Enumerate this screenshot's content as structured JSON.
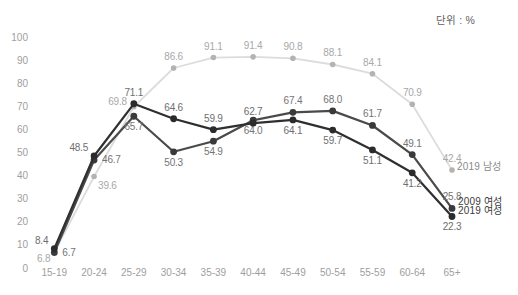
{
  "unit_label": "단위 : %",
  "colors": {
    "background": "#ffffff",
    "axis_label": "#9e9e9e",
    "unit_label_text": "#5f5f5f",
    "legend_male_text": "#8a8a8a",
    "legend_female_text": "#3a3a3a"
  },
  "chart_data": {
    "type": "line",
    "title": "",
    "unit": "단위 : %",
    "categories": [
      "15-19",
      "20-24",
      "25-29",
      "30-34",
      "35-39",
      "40-44",
      "45-49",
      "50-54",
      "55-59",
      "60-64",
      "65+"
    ],
    "y_ticks": [
      0,
      10,
      20,
      30,
      40,
      50,
      60,
      70,
      80,
      90,
      100
    ],
    "ylim": [
      0,
      100
    ],
    "grid": false,
    "legend_position": "right-end",
    "series": [
      {
        "name": "2019 남성",
        "values": [
          6.8,
          39.6,
          69.8,
          86.6,
          91.1,
          91.4,
          90.8,
          88.1,
          84.1,
          70.9,
          42.4
        ],
        "label_side": [
          "bl",
          "br",
          "l",
          "a",
          "a",
          "a",
          "a",
          "a",
          "a",
          "a",
          "a"
        ],
        "line_color": "#dcdcdc",
        "dot_color": "#b3b3b3",
        "label_color": "#a8a8a8",
        "line_width": 1.8,
        "dot_radius": 2.8
      },
      {
        "name": "2009 여성",
        "values": [
          6.7,
          46.7,
          65.7,
          50.3,
          54.9,
          64.0,
          67.4,
          68.0,
          61.7,
          49.1,
          25.8
        ],
        "label_side": [
          "r",
          "r",
          "b",
          "b",
          "b",
          "b",
          "a",
          "a",
          "a",
          "a",
          "a"
        ],
        "line_color": "#4a4a4a",
        "dot_color": "#3a3a3a",
        "label_color": "#747474",
        "line_width": 2.2,
        "dot_radius": 3.4
      },
      {
        "name": "2019 여성",
        "values": [
          8.4,
          48.5,
          71.1,
          64.6,
          59.9,
          62.7,
          64.1,
          59.7,
          51.1,
          41.2,
          22.3
        ],
        "label_side": [
          "la",
          "la",
          "a",
          "a",
          "a",
          "a",
          "b",
          "b",
          "b",
          "b",
          "b"
        ],
        "line_color": "#2f2f2f",
        "dot_color": "#2b2b2b",
        "label_color": "#6e6e6e",
        "line_width": 2.2,
        "dot_radius": 3.4
      }
    ]
  }
}
